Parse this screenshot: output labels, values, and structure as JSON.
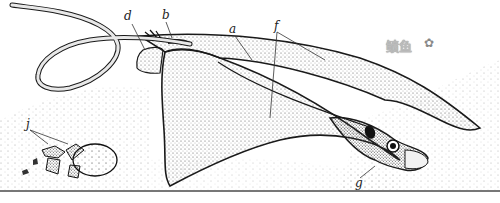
{
  "figure": {
    "labels": [
      {
        "id": "a",
        "text": "a"
      },
      {
        "id": "b",
        "text": "b"
      },
      {
        "id": "d",
        "text": "d"
      },
      {
        "id": "f",
        "text": "f"
      },
      {
        "id": "g",
        "text": "g"
      },
      {
        "id": "j",
        "text": "j"
      }
    ]
  },
  "watermark": {
    "text": "鲼鱼",
    "icon": "star-icon",
    "icon_glyph": "✿"
  },
  "colors": {
    "ink": "#1a1a1a",
    "stipple": "#555555",
    "background": "#ffffff",
    "watermark": "#bbbbbb"
  }
}
